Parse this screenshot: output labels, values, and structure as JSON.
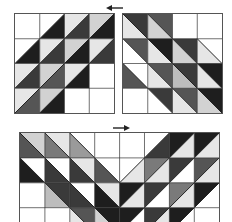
{
  "diagram": {
    "type": "quilt-assembly-diagram",
    "colors": {
      "W": "#ffffff",
      "L1": "#e6e6e6",
      "L2": "#d2d2d2",
      "L3": "#bdbdbd",
      "M1": "#9a9a9a",
      "M2": "#7a7a7a",
      "D1": "#555555",
      "D2": "#3a3a3a",
      "D3": "#1e1e1e",
      "line": "#222222",
      "border": "#555555"
    },
    "arrows": [
      {
        "name": "arrow-top",
        "direction": "left"
      },
      {
        "name": "arrow-bottom",
        "direction": "right"
      }
    ],
    "blocks": [
      {
        "name": "block-top-left",
        "x": 15,
        "y": 14,
        "cols": 4,
        "rows": 4,
        "cell": 24.75,
        "cells": [
          [
            {
              "d": "/",
              "a": "W",
              "b": "W"
            },
            {
              "d": "/",
              "a": "W",
              "b": "D3"
            },
            {
              "d": "/",
              "a": "L1",
              "b": "D2"
            },
            {
              "d": "/",
              "a": "L2",
              "b": "D3"
            }
          ],
          [
            {
              "d": "/",
              "a": "W",
              "b": "D3"
            },
            {
              "d": "/",
              "a": "L1",
              "b": "D2"
            },
            {
              "d": "/",
              "a": "L2",
              "b": "D3"
            },
            {
              "d": "/",
              "a": "L1",
              "b": "D2"
            }
          ],
          [
            {
              "d": "/",
              "a": "L1",
              "b": "D2"
            },
            {
              "d": "/",
              "a": "L2",
              "b": "D1"
            },
            {
              "d": "/",
              "a": "L1",
              "b": "D3"
            },
            {
              "d": "/",
              "a": "W",
              "b": "W"
            }
          ],
          [
            {
              "d": "/",
              "a": "L1",
              "b": "D1"
            },
            {
              "d": "/",
              "a": "L2",
              "b": "D3"
            },
            {
              "d": "/",
              "a": "W",
              "b": "W"
            },
            {
              "d": "/",
              "a": "W",
              "b": "W"
            }
          ]
        ]
      },
      {
        "name": "block-top-right",
        "x": 123,
        "y": 14,
        "cols": 4,
        "rows": 4,
        "cell": 24.75,
        "cells": [
          [
            {
              "d": "\\",
              "a": "D2",
              "b": "L1"
            },
            {
              "d": "\\",
              "a": "D1",
              "b": "L2"
            },
            {
              "d": "\\",
              "a": "W",
              "b": "W"
            },
            {
              "d": "\\",
              "a": "W",
              "b": "W"
            }
          ],
          [
            {
              "d": "\\",
              "a": "D1",
              "b": "W"
            },
            {
              "d": "\\",
              "a": "D3",
              "b": "L1"
            },
            {
              "d": "\\",
              "a": "D2",
              "b": "L2"
            },
            {
              "d": "\\",
              "a": "W",
              "b": "L1"
            }
          ],
          [
            {
              "d": "\\",
              "a": "W",
              "b": "D1"
            },
            {
              "d": "\\",
              "a": "D1",
              "b": "L1"
            },
            {
              "d": "\\",
              "a": "D2",
              "b": "L3"
            },
            {
              "d": "\\",
              "a": "D3",
              "b": "L1"
            }
          ],
          [
            {
              "d": "\\",
              "a": "W",
              "b": "W"
            },
            {
              "d": "\\",
              "a": "D2",
              "b": "W"
            },
            {
              "d": "\\",
              "a": "D1",
              "b": "L1"
            },
            {
              "d": "\\",
              "a": "D3",
              "b": "L2"
            }
          ]
        ]
      },
      {
        "name": "block-bottom-assembled",
        "x": 20,
        "y": 133,
        "cols": 8,
        "rows": 4,
        "cell": 24.9,
        "cells": [
          [
            {
              "d": "\\",
              "a": "L2",
              "b": "D1"
            },
            {
              "d": "\\",
              "a": "L1",
              "b": "M2"
            },
            {
              "d": "\\",
              "a": "W",
              "b": "M1"
            },
            {
              "d": "\\",
              "a": "W",
              "b": "W"
            },
            {
              "d": "/",
              "a": "W",
              "b": "W"
            },
            {
              "d": "/",
              "a": "W",
              "b": "D2"
            },
            {
              "d": "/",
              "a": "D3",
              "b": "L1"
            },
            {
              "d": "/",
              "a": "D3",
              "b": "L1"
            }
          ],
          [
            {
              "d": "\\",
              "a": "W",
              "b": "D3"
            },
            {
              "d": "\\",
              "a": "W",
              "b": "D2"
            },
            {
              "d": "\\",
              "a": "L1",
              "b": "D2"
            },
            {
              "d": "\\",
              "a": "W",
              "b": "D1"
            },
            {
              "d": "/",
              "a": "W",
              "b": "L1"
            },
            {
              "d": "/",
              "a": "M2",
              "b": "L1"
            },
            {
              "d": "/",
              "a": "D2",
              "b": "W"
            },
            {
              "d": "/",
              "a": "D1",
              "b": "L1"
            }
          ],
          [
            {
              "d": "\\",
              "a": "W",
              "b": "W"
            },
            {
              "d": "\\",
              "a": "D2",
              "b": "L3"
            },
            {
              "d": "\\",
              "a": "W",
              "b": "D2"
            },
            {
              "d": "\\",
              "a": "L1",
              "b": "D3"
            },
            {
              "d": "/",
              "a": "D3",
              "b": "L1"
            },
            {
              "d": "/",
              "a": "D2",
              "b": "W"
            },
            {
              "d": "/",
              "a": "M2",
              "b": "L1"
            },
            {
              "d": "/",
              "a": "D3",
              "b": "W"
            }
          ],
          [
            {
              "d": "\\",
              "a": "W",
              "b": "W"
            },
            {
              "d": "\\",
              "a": "W",
              "b": "W"
            },
            {
              "d": "\\",
              "a": "D1",
              "b": "L1"
            },
            {
              "d": "\\",
              "a": "D3",
              "b": "L2"
            },
            {
              "d": "/",
              "a": "D3",
              "b": "W"
            },
            {
              "d": "/",
              "a": "D2",
              "b": "L1"
            },
            {
              "d": "/",
              "a": "D3",
              "b": "W"
            },
            {
              "d": "/",
              "a": "W",
              "b": "W"
            }
          ]
        ]
      }
    ]
  }
}
